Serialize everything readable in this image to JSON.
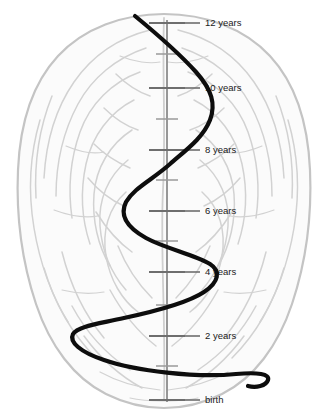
{
  "figure": {
    "name": "brain-development-timeline",
    "width": 329,
    "height": 417
  },
  "colors": {
    "background": "#ffffff",
    "brain_outline": "#c9c9c9",
    "brain_texture": "#d8d8d8",
    "axis": "#8c8c8c",
    "tick_major": "#6e6e6e",
    "tick_minor": "#9a9a9a",
    "curve": "#0d0d0d",
    "label_text": "#1a1a1a"
  },
  "axis": {
    "name": "age-timeline-axis",
    "x": 167,
    "y_top": 20,
    "y_bottom": 402,
    "orientation": "vertical",
    "direction": "birth at bottom, 12 years at top"
  },
  "chart_data": {
    "type": "line",
    "title": "",
    "subtitle": "",
    "xlabel": "",
    "ylabel": "",
    "orientation": "vertical-time-axis",
    "axis_range": [
      "birth",
      "12 years"
    ],
    "grid": false,
    "legend": "none",
    "ticks": [
      {
        "label": "12 years",
        "value": 12,
        "major": true,
        "y": 23
      },
      {
        "label": "",
        "value": 11,
        "major": false,
        "y": 54
      },
      {
        "label": "10 years",
        "value": 10,
        "major": true,
        "y": 88
      },
      {
        "label": "",
        "value": 9,
        "major": false,
        "y": 119
      },
      {
        "label": "8 years",
        "value": 8,
        "major": true,
        "y": 150
      },
      {
        "label": "",
        "value": 7,
        "major": false,
        "y": 180
      },
      {
        "label": "6 years",
        "value": 6,
        "major": true,
        "y": 211
      },
      {
        "label": "",
        "value": 5,
        "major": false,
        "y": 241
      },
      {
        "label": "4 years",
        "value": 4,
        "major": true,
        "y": 272
      },
      {
        "label": "",
        "value": 3,
        "major": false,
        "y": 305
      },
      {
        "label": "2 years",
        "value": 2,
        "major": true,
        "y": 336
      },
      {
        "label": "",
        "value": 1,
        "major": false,
        "y": 366
      },
      {
        "label": "birth",
        "value": 0,
        "major": true,
        "y": 400
      }
    ],
    "curve_description": "A thick black sinusoidal spiral oscillating horizontally about the vertical age axis; amplitude increases from birth upward in the lower half then narrows toward 12 years",
    "curve_extrema": [
      {
        "age": 12.2,
        "x": 135,
        "y": 16,
        "note": "curve start, upper-left"
      },
      {
        "age": 9.6,
        "x": 215,
        "y": 100,
        "note": "right peak"
      },
      {
        "age": 6.6,
        "x": 125,
        "y": 196,
        "note": "left peak"
      },
      {
        "age": 4.1,
        "x": 218,
        "y": 273,
        "note": "right peak"
      },
      {
        "age": 2.3,
        "x": 73,
        "y": 334,
        "note": "left peak, widest"
      },
      {
        "age": 0.2,
        "x": 268,
        "y": 374,
        "note": "right hook"
      },
      {
        "age": 0.1,
        "x": 248,
        "y": 386,
        "note": "curve end, bottom"
      }
    ]
  }
}
